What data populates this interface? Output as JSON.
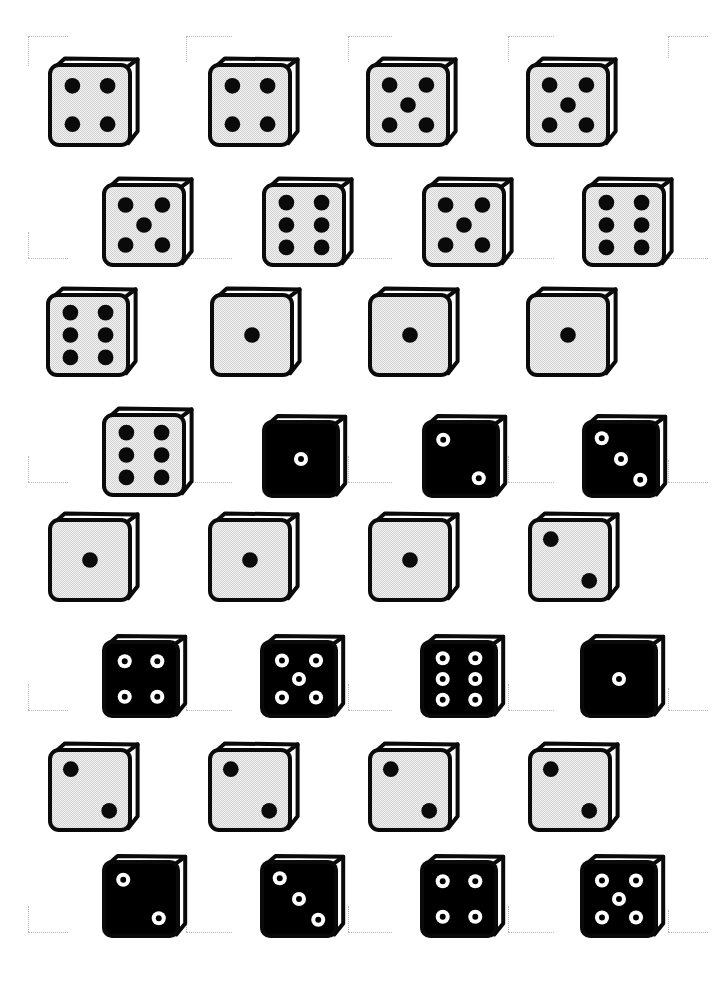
{
  "page": {
    "background_color": "#ffffff",
    "width": 714,
    "height": 982
  },
  "palette": {
    "ink": "#0a0a0a",
    "face_light": "#ececec",
    "face_dark": "#000000",
    "pip_dark": "#0a0a0a",
    "pip_light": "#ffffff",
    "paper": "#ffffff",
    "crop_mark": "#b9b9b9"
  },
  "legend": {
    "light_die_label": "light die, black pips",
    "dark_die_label": "black die, white ring pips"
  },
  "dice": [
    {
      "id": "die-r1c1",
      "row": 1,
      "col": 1,
      "value": 4,
      "style": "light",
      "x": 46,
      "y": 50,
      "size": 80
    },
    {
      "id": "die-r1c2",
      "row": 1,
      "col": 2,
      "value": 4,
      "style": "light",
      "x": 206,
      "y": 50,
      "size": 80
    },
    {
      "id": "die-r1c3",
      "row": 1,
      "col": 3,
      "value": 5,
      "style": "light",
      "x": 364,
      "y": 50,
      "size": 80
    },
    {
      "id": "die-r1c4",
      "row": 1,
      "col": 4,
      "value": 5,
      "style": "light",
      "x": 524,
      "y": 50,
      "size": 80
    },
    {
      "id": "die-r2c1",
      "row": 2,
      "col": 1,
      "value": 5,
      "style": "light",
      "x": 100,
      "y": 170,
      "size": 80
    },
    {
      "id": "die-r2c2",
      "row": 2,
      "col": 2,
      "value": 6,
      "style": "light",
      "x": 260,
      "y": 170,
      "size": 80
    },
    {
      "id": "die-r2c3",
      "row": 2,
      "col": 3,
      "value": 5,
      "style": "light",
      "x": 420,
      "y": 170,
      "size": 80
    },
    {
      "id": "die-r2c4",
      "row": 2,
      "col": 4,
      "value": 6,
      "style": "light",
      "x": 580,
      "y": 170,
      "size": 80
    },
    {
      "id": "die-r3c1",
      "row": 3,
      "col": 1,
      "value": 6,
      "style": "light",
      "x": 44,
      "y": 280,
      "size": 80
    },
    {
      "id": "die-r3c2",
      "row": 3,
      "col": 2,
      "value": 1,
      "style": "light",
      "x": 208,
      "y": 280,
      "size": 80
    },
    {
      "id": "die-r3c3",
      "row": 3,
      "col": 3,
      "value": 1,
      "style": "light",
      "x": 366,
      "y": 280,
      "size": 80
    },
    {
      "id": "die-r3c4",
      "row": 3,
      "col": 4,
      "value": 1,
      "style": "light",
      "x": 524,
      "y": 280,
      "size": 80
    },
    {
      "id": "die-r4c1",
      "row": 4,
      "col": 1,
      "value": 6,
      "style": "light",
      "x": 100,
      "y": 400,
      "size": 80
    },
    {
      "id": "die-r4c2",
      "row": 4,
      "col": 2,
      "value": 1,
      "style": "dark",
      "x": 260,
      "y": 408,
      "size": 74
    },
    {
      "id": "die-r4c3",
      "row": 4,
      "col": 3,
      "value": 2,
      "style": "dark",
      "x": 420,
      "y": 408,
      "size": 74
    },
    {
      "id": "die-r4c4",
      "row": 4,
      "col": 4,
      "value": 3,
      "style": "dark",
      "x": 580,
      "y": 408,
      "size": 74
    },
    {
      "id": "die-r5c1",
      "row": 5,
      "col": 1,
      "value": 1,
      "style": "light",
      "x": 46,
      "y": 505,
      "size": 80
    },
    {
      "id": "die-r5c2",
      "row": 5,
      "col": 2,
      "value": 1,
      "style": "light",
      "x": 206,
      "y": 505,
      "size": 80
    },
    {
      "id": "die-r5c3",
      "row": 5,
      "col": 3,
      "value": 1,
      "style": "light",
      "x": 366,
      "y": 505,
      "size": 80
    },
    {
      "id": "die-r5c4",
      "row": 5,
      "col": 4,
      "value": 2,
      "style": "light",
      "x": 526,
      "y": 505,
      "size": 80
    },
    {
      "id": "die-r6c1",
      "row": 6,
      "col": 1,
      "value": 4,
      "style": "dark",
      "x": 100,
      "y": 628,
      "size": 74
    },
    {
      "id": "die-r6c2",
      "row": 6,
      "col": 2,
      "value": 5,
      "style": "dark",
      "x": 258,
      "y": 628,
      "size": 74
    },
    {
      "id": "die-r6c3",
      "row": 6,
      "col": 3,
      "value": 6,
      "style": "dark",
      "x": 418,
      "y": 628,
      "size": 74
    },
    {
      "id": "die-r6c4",
      "row": 6,
      "col": 4,
      "value": 1,
      "style": "dark",
      "x": 578,
      "y": 628,
      "size": 74
    },
    {
      "id": "die-r7c1",
      "row": 7,
      "col": 1,
      "value": 2,
      "style": "light",
      "x": 46,
      "y": 735,
      "size": 80
    },
    {
      "id": "die-r7c2",
      "row": 7,
      "col": 2,
      "value": 2,
      "style": "light",
      "x": 206,
      "y": 735,
      "size": 80
    },
    {
      "id": "die-r7c3",
      "row": 7,
      "col": 3,
      "value": 2,
      "style": "light",
      "x": 366,
      "y": 735,
      "size": 80
    },
    {
      "id": "die-r7c4",
      "row": 7,
      "col": 4,
      "value": 2,
      "style": "light",
      "x": 526,
      "y": 735,
      "size": 80
    },
    {
      "id": "die-r8c1",
      "row": 8,
      "col": 1,
      "value": 2,
      "style": "dark",
      "x": 100,
      "y": 848,
      "size": 74
    },
    {
      "id": "die-r8c2",
      "row": 8,
      "col": 2,
      "value": 3,
      "style": "dark",
      "x": 258,
      "y": 848,
      "size": 74
    },
    {
      "id": "die-r8c3",
      "row": 8,
      "col": 3,
      "value": 4,
      "style": "dark",
      "x": 418,
      "y": 848,
      "size": 74
    },
    {
      "id": "die-r8c4",
      "row": 8,
      "col": 4,
      "value": 5,
      "style": "dark",
      "x": 578,
      "y": 848,
      "size": 74
    }
  ],
  "crop_marks": [
    {
      "id": "cm-1",
      "x": 28,
      "y": 36,
      "hw": 40,
      "vh": 30,
      "corner": "tl"
    },
    {
      "id": "cm-2",
      "x": 186,
      "y": 36,
      "hw": 46,
      "vh": 26,
      "corner": "tl"
    },
    {
      "id": "cm-3",
      "x": 348,
      "y": 36,
      "hw": 44,
      "vh": 26,
      "corner": "tl"
    },
    {
      "id": "cm-4",
      "x": 508,
      "y": 36,
      "hw": 46,
      "vh": 26,
      "corner": "tl"
    },
    {
      "id": "cm-5",
      "x": 668,
      "y": 36,
      "hw": 40,
      "vh": 22,
      "corner": "tl"
    },
    {
      "id": "cm-6",
      "x": 28,
      "y": 258,
      "hw": 40,
      "vh": 26,
      "corner": "bl"
    },
    {
      "id": "cm-7",
      "x": 186,
      "y": 258,
      "hw": 46,
      "vh": 26,
      "corner": "bl"
    },
    {
      "id": "cm-8",
      "x": 348,
      "y": 258,
      "hw": 44,
      "vh": 26,
      "corner": "bl"
    },
    {
      "id": "cm-9",
      "x": 508,
      "y": 258,
      "hw": 46,
      "vh": 26,
      "corner": "bl"
    },
    {
      "id": "cm-10",
      "x": 668,
      "y": 258,
      "hw": 40,
      "vh": 22,
      "corner": "bl"
    },
    {
      "id": "cm-11",
      "x": 28,
      "y": 482,
      "hw": 40,
      "vh": 26,
      "corner": "bl"
    },
    {
      "id": "cm-12",
      "x": 186,
      "y": 482,
      "hw": 46,
      "vh": 26,
      "corner": "bl"
    },
    {
      "id": "cm-13",
      "x": 348,
      "y": 482,
      "hw": 44,
      "vh": 26,
      "corner": "bl"
    },
    {
      "id": "cm-14",
      "x": 508,
      "y": 482,
      "hw": 46,
      "vh": 26,
      "corner": "bl"
    },
    {
      "id": "cm-15",
      "x": 668,
      "y": 482,
      "hw": 40,
      "vh": 22,
      "corner": "bl"
    },
    {
      "id": "cm-16",
      "x": 28,
      "y": 710,
      "hw": 40,
      "vh": 26,
      "corner": "bl"
    },
    {
      "id": "cm-17",
      "x": 186,
      "y": 710,
      "hw": 46,
      "vh": 26,
      "corner": "bl"
    },
    {
      "id": "cm-18",
      "x": 348,
      "y": 710,
      "hw": 44,
      "vh": 26,
      "corner": "bl"
    },
    {
      "id": "cm-19",
      "x": 508,
      "y": 710,
      "hw": 46,
      "vh": 26,
      "corner": "bl"
    },
    {
      "id": "cm-20",
      "x": 668,
      "y": 710,
      "hw": 40,
      "vh": 22,
      "corner": "bl"
    },
    {
      "id": "cm-21",
      "x": 28,
      "y": 932,
      "hw": 40,
      "vh": 26,
      "corner": "bl"
    },
    {
      "id": "cm-22",
      "x": 186,
      "y": 932,
      "hw": 46,
      "vh": 26,
      "corner": "bl"
    },
    {
      "id": "cm-23",
      "x": 348,
      "y": 932,
      "hw": 44,
      "vh": 26,
      "corner": "bl"
    },
    {
      "id": "cm-24",
      "x": 508,
      "y": 932,
      "hw": 46,
      "vh": 26,
      "corner": "bl"
    },
    {
      "id": "cm-25",
      "x": 668,
      "y": 932,
      "hw": 40,
      "vh": 22,
      "corner": "bl"
    }
  ]
}
